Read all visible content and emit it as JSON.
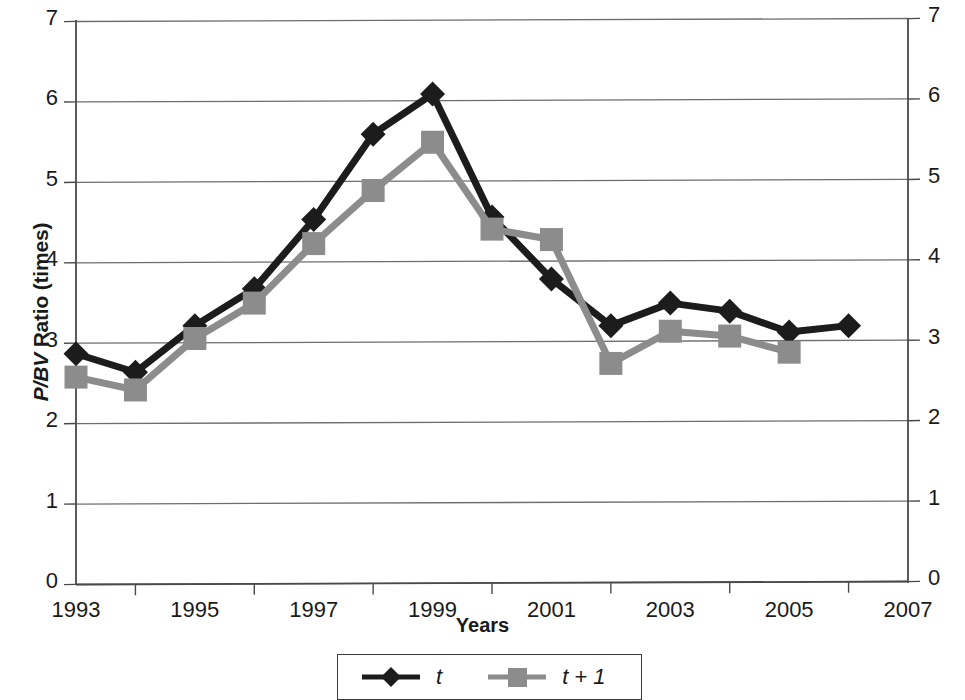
{
  "chart_data": {
    "type": "line",
    "title": "",
    "xlabel": "Years",
    "ylabel": "P/BV Ratio (times)",
    "ylabel_italic_part": "P/BV",
    "ylabel_plain_part": " Ratio (times)",
    "xlim": [
      1993,
      2007
    ],
    "ylim": [
      0,
      7
    ],
    "grid": true,
    "dual_y_axis": true,
    "y_ticks": [
      0,
      1,
      2,
      3,
      4,
      5,
      6,
      7
    ],
    "y_tick_labels": [
      "0",
      "1",
      "2",
      "3",
      "4",
      "5",
      "6",
      "7"
    ],
    "x_ticks": [
      1993,
      1995,
      1997,
      1999,
      2001,
      2003,
      2005,
      2007
    ],
    "x_tick_labels": [
      "1993",
      "1995",
      "1997",
      "1999",
      "2001",
      "2003",
      "2005",
      "2007"
    ],
    "x_minor_ticks": [
      1994,
      1996,
      1998,
      2000,
      2002,
      2004,
      2006
    ],
    "legend_position": "bottom",
    "series": [
      {
        "name": "t",
        "color": "#1c1c1c",
        "marker": "diamond",
        "x": [
          1993,
          1994,
          1995,
          1996,
          1997,
          1998,
          1999,
          2000,
          2001,
          2002,
          2003,
          2004,
          2005,
          2006
        ],
        "values": [
          2.85,
          2.62,
          3.2,
          3.66,
          4.52,
          5.58,
          6.08,
          4.55,
          3.78,
          3.2,
          3.48,
          3.38,
          3.12,
          3.2
        ]
      },
      {
        "name": "t + 1",
        "color": "#8c8c8c",
        "marker": "square",
        "x": [
          1993,
          1994,
          1995,
          1996,
          1997,
          1998,
          1999,
          2000,
          2001,
          2002,
          2003,
          2004,
          2005
        ],
        "values": [
          2.56,
          2.4,
          3.04,
          3.48,
          4.22,
          4.88,
          5.48,
          4.4,
          4.27,
          2.73,
          3.13,
          3.07,
          2.87
        ]
      }
    ]
  },
  "legend": {
    "items": [
      {
        "label": "t"
      },
      {
        "label": "t + 1"
      }
    ]
  },
  "colors": {
    "series_t": "#1c1c1c",
    "series_t_plus_1": "#8c8c8c",
    "grid": "#6e6e6e",
    "axis": "#4a4a4a",
    "text": "#1a1a1a",
    "background": "#ffffff"
  }
}
